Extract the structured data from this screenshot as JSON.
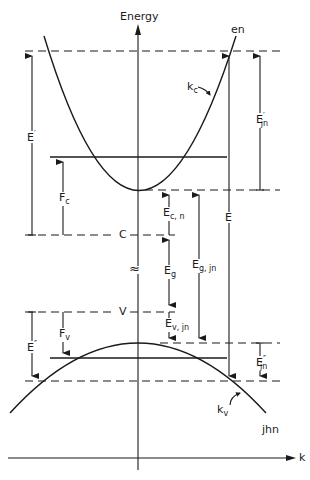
{
  "diagram": {
    "type": "band diagram (energy vs k)",
    "axes": {
      "y_label": "Energy",
      "x_label": "k"
    },
    "curves": {
      "conduction_band": {
        "label": "en",
        "tangent_label": "k",
        "tangent_sub": "c"
      },
      "valence_band": {
        "label": "jhn",
        "tangent_label": "k",
        "tangent_sub": "v"
      }
    },
    "levels": {
      "conduction_edge": "C",
      "valence_edge": "V"
    },
    "labels": {
      "E_prime": {
        "main": "E",
        "sup": "′"
      },
      "Fc": {
        "main": "F",
        "sub": "c"
      },
      "Fv": {
        "main": "F",
        "sub": "v"
      },
      "E_dprime": {
        "main": "E",
        "sup": "″"
      },
      "Ejn_prime": {
        "main": "E",
        "sup": "′",
        "sub": "jn"
      },
      "Ejn_dprime": {
        "main": "E",
        "sup": "″",
        "sub": "jn"
      },
      "Ecn": {
        "main": "E",
        "sub": "c, n"
      },
      "Eg": {
        "main": "E",
        "sub": "g"
      },
      "Evjn": {
        "main": "E",
        "sub": "v, jn"
      },
      "Egjn": {
        "main": "E",
        "sub": "g, jn"
      },
      "E": {
        "main": "E"
      }
    },
    "break_symbol": "≈"
  },
  "colors": {
    "line": "#1a1a1a",
    "background": "#ffffff"
  }
}
